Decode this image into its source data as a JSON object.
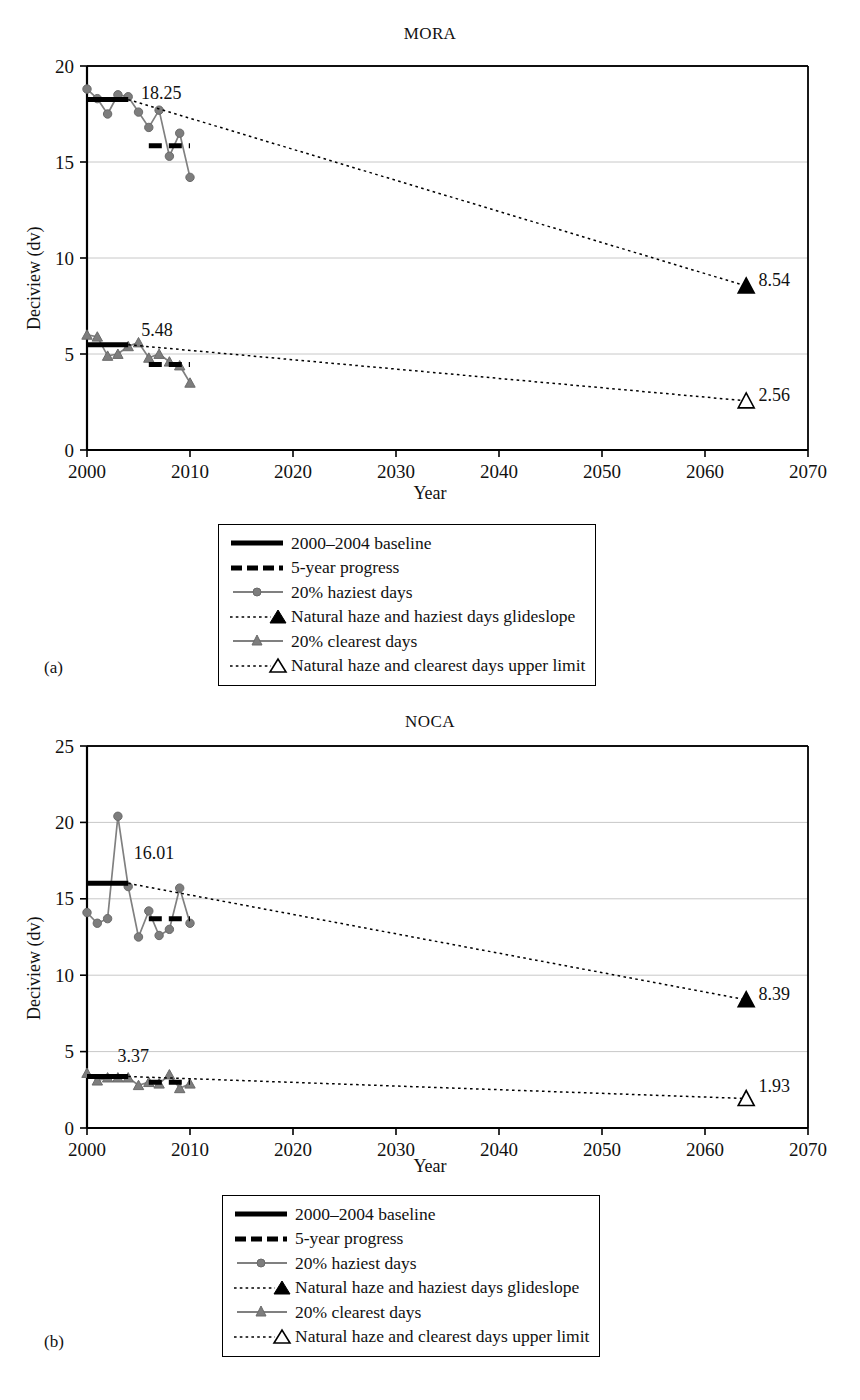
{
  "figure": {
    "panels": [
      {
        "tag": "(a)",
        "site": "MORA"
      },
      {
        "tag": "(b)",
        "site": "NOCA"
      }
    ]
  },
  "legend": {
    "items": [
      {
        "key": "solid-thick-black-line",
        "label": "2000–2004 baseline"
      },
      {
        "key": "dashed-thick-black-line",
        "label": "5-year progress"
      },
      {
        "key": "gray-line-circle-marker",
        "label": "20% haziest days"
      },
      {
        "key": "dotted-line-filled-triangle",
        "label": "Natural haze and haziest days glideslope"
      },
      {
        "key": "gray-line-triangle-marker",
        "label": "20% clearest days"
      },
      {
        "key": "dotted-line-open-triangle",
        "label": "Natural haze and clearest days upper limit"
      }
    ]
  },
  "colors": {
    "axis": "#000000",
    "gridline": "#c8c8c8",
    "series_gray": "#808080",
    "marker_gray": "#7d7d7d",
    "baseline_black": "#000000",
    "glideslope_black": "#000000",
    "background": "#ffffff"
  },
  "chart_data": [
    {
      "type": "line",
      "title": "MORA",
      "panel": "(a)",
      "xlabel": "Year",
      "ylabel": "Deciview (dv)",
      "xlim": [
        2000,
        2070
      ],
      "ylim": [
        0,
        20
      ],
      "xticks": [
        2000,
        2010,
        2020,
        2030,
        2040,
        2050,
        2060,
        2070
      ],
      "yticks": [
        0,
        5,
        10,
        15,
        20
      ],
      "grid": "horizontal",
      "legend_position": "below-plot",
      "annotations": [
        {
          "text": "18.25",
          "x": 2007.2,
          "y": 18.3,
          "role": "haziest-baseline-value"
        },
        {
          "text": "5.48",
          "x": 2006.8,
          "y": 5.95,
          "role": "clearest-baseline-value"
        },
        {
          "text": "8.54",
          "x": 2065.2,
          "y": 8.54,
          "role": "haziest-glideslope-endpoint"
        },
        {
          "text": "2.56",
          "x": 2065.2,
          "y": 2.56,
          "role": "clearest-endpoint"
        }
      ],
      "series": [
        {
          "name": "20% haziest days",
          "marker": "circle",
          "color": "#808080",
          "x": [
            2000,
            2001,
            2002,
            2003,
            2004,
            2005,
            2006,
            2007,
            2008,
            2009,
            2010
          ],
          "values": [
            18.8,
            18.3,
            17.5,
            18.5,
            18.4,
            17.6,
            16.8,
            17.7,
            15.3,
            16.5,
            14.2
          ]
        },
        {
          "name": "20% clearest days",
          "marker": "triangle",
          "color": "#808080",
          "x": [
            2000,
            2001,
            2002,
            2003,
            2004,
            2005,
            2006,
            2007,
            2008,
            2009,
            2010
          ],
          "values": [
            6.0,
            5.9,
            4.9,
            5.0,
            5.4,
            5.6,
            4.8,
            5.0,
            4.6,
            4.4,
            3.5
          ]
        },
        {
          "name": "2000–2004 baseline (haziest)",
          "type": "segment",
          "x": [
            2000,
            2004
          ],
          "values": [
            18.25,
            18.25
          ]
        },
        {
          "name": "5-year progress (haziest)",
          "type": "segment-dashed",
          "x": [
            2006,
            2010
          ],
          "values": [
            15.85,
            15.85
          ]
        },
        {
          "name": "2000–2004 baseline (clearest)",
          "type": "segment",
          "x": [
            2000,
            2004
          ],
          "values": [
            5.48,
            5.48
          ]
        },
        {
          "name": "5-year progress (clearest)",
          "type": "segment-dashed",
          "x": [
            2006,
            2010
          ],
          "values": [
            4.45,
            4.45
          ]
        },
        {
          "name": "Natural haze and haziest days glideslope",
          "type": "dotted-line",
          "x": [
            2004,
            2064
          ],
          "values": [
            18.25,
            8.54
          ],
          "endpoint_marker": "filled-triangle"
        },
        {
          "name": "Natural haze and clearest days upper limit",
          "type": "dotted-line",
          "x": [
            2004,
            2064
          ],
          "values": [
            5.48,
            2.56
          ],
          "endpoint_marker": "open-triangle"
        }
      ]
    },
    {
      "type": "line",
      "title": "NOCA",
      "panel": "(b)",
      "xlabel": "Year",
      "ylabel": "Deciview (dv)",
      "xlim": [
        2000,
        2070
      ],
      "ylim": [
        0,
        25
      ],
      "xticks": [
        2000,
        2010,
        2020,
        2030,
        2040,
        2050,
        2060,
        2070
      ],
      "yticks": [
        0,
        5,
        10,
        15,
        20,
        25
      ],
      "grid": "horizontal",
      "legend_position": "below-plot",
      "annotations": [
        {
          "text": "16.01",
          "x": 2006.5,
          "y": 17.6,
          "role": "haziest-baseline-value"
        },
        {
          "text": "3.37",
          "x": 2004.5,
          "y": 4.35,
          "role": "clearest-baseline-value"
        },
        {
          "text": "8.39",
          "x": 2065.2,
          "y": 8.39,
          "role": "haziest-glideslope-endpoint"
        },
        {
          "text": "1.93",
          "x": 2065.2,
          "y": 2.35,
          "role": "clearest-endpoint"
        }
      ],
      "series": [
        {
          "name": "20% haziest days",
          "marker": "circle",
          "color": "#808080",
          "x": [
            2000,
            2001,
            2002,
            2003,
            2004,
            2005,
            2006,
            2007,
            2008,
            2009,
            2010
          ],
          "values": [
            14.1,
            13.4,
            13.7,
            20.4,
            15.8,
            12.5,
            14.2,
            12.6,
            13.0,
            15.7,
            13.4
          ]
        },
        {
          "name": "20% clearest days",
          "marker": "triangle",
          "color": "#808080",
          "x": [
            2000,
            2001,
            2002,
            2003,
            2004,
            2005,
            2006,
            2007,
            2008,
            2009,
            2010
          ],
          "values": [
            3.6,
            3.1,
            3.3,
            3.3,
            3.3,
            2.8,
            3.0,
            2.9,
            3.5,
            2.6,
            2.9
          ]
        },
        {
          "name": "2000–2004 baseline (haziest)",
          "type": "segment",
          "x": [
            2000,
            2004
          ],
          "values": [
            16.01,
            16.01
          ]
        },
        {
          "name": "5-year progress (haziest)",
          "type": "segment-dashed",
          "x": [
            2006,
            2010
          ],
          "values": [
            13.7,
            13.7
          ]
        },
        {
          "name": "2000–2004 baseline (clearest)",
          "type": "segment",
          "x": [
            2000,
            2004
          ],
          "values": [
            3.37,
            3.37
          ]
        },
        {
          "name": "5-year progress (clearest)",
          "type": "segment-dashed",
          "x": [
            2006,
            2010
          ],
          "values": [
            3.0,
            3.0
          ]
        },
        {
          "name": "Natural haze and haziest days glideslope",
          "type": "dotted-line",
          "x": [
            2004,
            2064
          ],
          "values": [
            16.01,
            8.39
          ],
          "endpoint_marker": "filled-triangle"
        },
        {
          "name": "Natural haze and clearest days upper limit",
          "type": "dotted-line",
          "x": [
            2004,
            2064
          ],
          "values": [
            3.37,
            1.93
          ],
          "endpoint_marker": "open-triangle"
        }
      ]
    }
  ]
}
